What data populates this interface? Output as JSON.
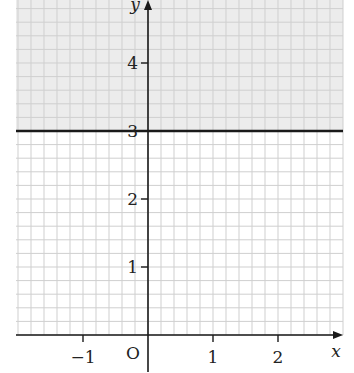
{
  "chart_data": {
    "type": "line",
    "title": "",
    "xlabel": "x",
    "ylabel": "y",
    "origin_label": "O",
    "x_ticks": [
      -1,
      1,
      2
    ],
    "x_tick_labels": [
      "−1",
      "1",
      "2"
    ],
    "y_ticks": [
      1,
      2,
      3,
      4
    ],
    "y_tick_labels": [
      "1",
      "2",
      "3",
      "4"
    ],
    "xlim": [
      -2,
      3
    ],
    "ylim": [
      0,
      5
    ],
    "grid": true,
    "grid_subdivisions": 5,
    "series": [
      {
        "name": "y = 3",
        "x": [
          -2,
          3
        ],
        "y": [
          3,
          3
        ],
        "style": "solid-thick"
      }
    ],
    "shaded_region": {
      "condition": "y > 3",
      "color": "#ececec"
    }
  },
  "colors": {
    "grid": "#cfcfcf",
    "axis": "#1a1a1a",
    "line": "#1a1a1a",
    "shade": "#ececec"
  }
}
